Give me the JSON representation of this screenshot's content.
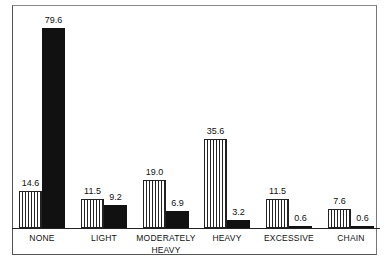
{
  "chart_data": {
    "type": "bar",
    "title": "",
    "xlabel": "",
    "ylabel": "",
    "ylim": [
      0,
      80
    ],
    "grid": false,
    "legend": null,
    "categories": [
      "NONE",
      "LIGHT",
      "MODERATELY HEAVY",
      "HEAVY",
      "EXCESSIVE",
      "CHAIN"
    ],
    "series": [
      {
        "name": "Series 1 (hatched)",
        "values": [
          14.6,
          11.5,
          19.0,
          35.6,
          11.5,
          7.6
        ]
      },
      {
        "name": "Series 2 (solid black)",
        "values": [
          79.6,
          9.2,
          6.9,
          3.2,
          0.6,
          0.6
        ]
      }
    ],
    "labels": {
      "s1": [
        "14.6",
        "11.5",
        "19.0",
        "35.6",
        "11.5",
        "7.6"
      ],
      "s2": [
        "79.6",
        "9.2",
        "6.9",
        "3.2",
        "0.6",
        "0.6"
      ]
    },
    "category_lines": [
      [
        "NONE"
      ],
      [
        "LIGHT"
      ],
      [
        "MODERATELY",
        "HEAVY"
      ],
      [
        "HEAVY"
      ],
      [
        "EXCESSIVE"
      ],
      [
        "CHAIN"
      ]
    ]
  }
}
